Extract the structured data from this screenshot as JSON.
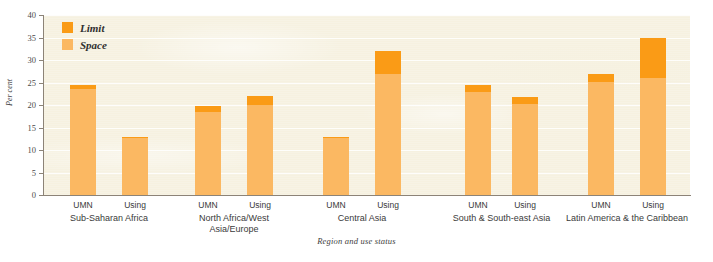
{
  "chart_data": {
    "type": "bar",
    "title": "",
    "subtitle": "",
    "xlabel": "Region and use status",
    "ylabel": "Per cent",
    "ylim": [
      0,
      40
    ],
    "yticks": [
      0,
      5,
      10,
      15,
      20,
      25,
      30,
      35,
      40
    ],
    "grid": true,
    "stacked": true,
    "legend_position": "top-left",
    "legend": [
      {
        "name": "Limit",
        "color": "#fa9b16"
      },
      {
        "name": "Space",
        "color": "#fbb862"
      }
    ],
    "series": [
      {
        "name": "Space",
        "color": "#fbb862",
        "values": [
          23.5,
          12.7,
          18.5,
          20.0,
          12.8,
          27.0,
          23.0,
          20.3,
          25.2,
          26.0
        ]
      },
      {
        "name": "Limit",
        "color": "#fa9b16",
        "values": [
          1.0,
          0.3,
          1.3,
          2.0,
          0.2,
          5.0,
          1.5,
          1.4,
          1.8,
          9.0
        ]
      }
    ],
    "totals": [
      24.5,
      13.0,
      19.8,
      22.0,
      13.0,
      32.0,
      24.5,
      21.7,
      27.0,
      35.0
    ],
    "categories": [
      "UMN",
      "Using",
      "UMN",
      "Using",
      "UMN",
      "Using",
      "UMN",
      "Using",
      "UMN",
      "Using"
    ],
    "groups": [
      {
        "label": "Sub-Saharan Africa",
        "statuses": [
          "UMN",
          "Using"
        ]
      },
      {
        "label": "North Africa/West\nAsia/Europe",
        "statuses": [
          "UMN",
          "Using"
        ]
      },
      {
        "label": "Central Asia",
        "statuses": [
          "UMN",
          "Using"
        ]
      },
      {
        "label": "South & South-east Asia",
        "statuses": [
          "UMN",
          "Using"
        ]
      },
      {
        "label": "Latin America & the Caribbean",
        "statuses": [
          "UMN",
          "Using"
        ]
      }
    ],
    "bars": [
      {
        "group": "Sub-Saharan Africa",
        "status": "UMN",
        "space": 23.5,
        "limit": 1.0,
        "total": 24.5
      },
      {
        "group": "Sub-Saharan Africa",
        "status": "Using",
        "space": 12.7,
        "limit": 0.3,
        "total": 13.0
      },
      {
        "group": "North Africa/West Asia/Europe",
        "status": "UMN",
        "space": 18.5,
        "limit": 1.3,
        "total": 19.8
      },
      {
        "group": "North Africa/West Asia/Europe",
        "status": "Using",
        "space": 20.0,
        "limit": 2.0,
        "total": 22.0
      },
      {
        "group": "Central Asia",
        "status": "UMN",
        "space": 12.8,
        "limit": 0.2,
        "total": 13.0
      },
      {
        "group": "Central Asia",
        "status": "Using",
        "space": 27.0,
        "limit": 5.0,
        "total": 32.0
      },
      {
        "group": "South & South-east Asia",
        "status": "UMN",
        "space": 23.0,
        "limit": 1.5,
        "total": 24.5
      },
      {
        "group": "South & South-east Asia",
        "status": "Using",
        "space": 20.3,
        "limit": 1.4,
        "total": 21.7
      },
      {
        "group": "Latin America & the Caribbean",
        "status": "UMN",
        "space": 25.2,
        "limit": 1.8,
        "total": 27.0
      },
      {
        "group": "Latin America & the Caribbean",
        "status": "Using",
        "space": 26.0,
        "limit": 9.0,
        "total": 35.0
      }
    ]
  },
  "colors": {
    "limit": "#fa9b16",
    "space": "#fbb862",
    "plot_background": "#f6f1e0",
    "axis": "#8c8377",
    "text": "#3a3a3a"
  }
}
